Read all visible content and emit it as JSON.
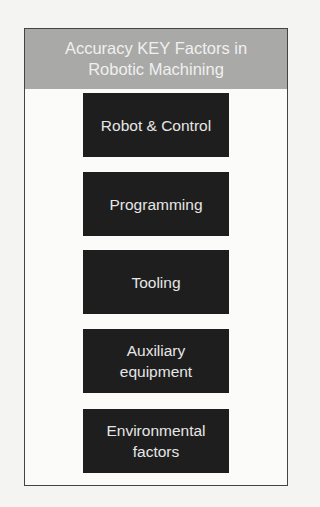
{
  "diagram": {
    "title": "Accuracy KEY Factors in Robotic Machining",
    "title_lines": [
      "Accuracy KEY Factors in",
      "Robotic Machining"
    ],
    "factors": [
      {
        "label": "Robot & Control"
      },
      {
        "label": "Programming"
      },
      {
        "label": "Tooling"
      },
      {
        "label_lines": [
          "Auxiliary",
          "equipment"
        ]
      },
      {
        "label_lines": [
          "Environmental",
          "factors"
        ]
      }
    ]
  },
  "colors": {
    "header_bg": "#a9a9a7",
    "box_bg": "#1e1e1e",
    "box_text": "#e6e6e6"
  }
}
